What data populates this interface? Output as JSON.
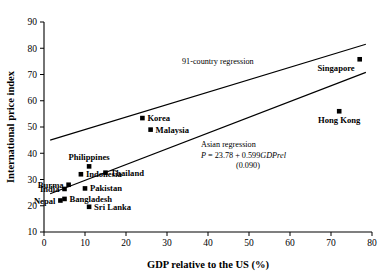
{
  "chart_data": {
    "type": "scatter",
    "title": "",
    "xlabel": "GDP relative to the US (%)",
    "ylabel": "International price index",
    "xlim": [
      0,
      80
    ],
    "ylim": [
      10,
      90
    ],
    "xticks": [
      0,
      10,
      20,
      30,
      40,
      50,
      60,
      70,
      80
    ],
    "yticks": [
      10,
      20,
      30,
      40,
      50,
      60,
      70,
      80,
      90
    ],
    "grid": false,
    "legend": "none",
    "points": [
      {
        "label": "Nepal",
        "x": 4,
        "y": 22.0,
        "label_pos": "left"
      },
      {
        "label": "Bangladesh",
        "x": 5,
        "y": 22.6,
        "label_pos": "right"
      },
      {
        "label": "India",
        "x": 5,
        "y": 26.4,
        "label_pos": "left"
      },
      {
        "label": "Burma",
        "x": 6,
        "y": 28.0,
        "label_pos": "left"
      },
      {
        "label": "Indonesia",
        "x": 9,
        "y": 32.0,
        "label_pos": "right"
      },
      {
        "label": "Pakistan",
        "x": 10,
        "y": 26.6,
        "label_pos": "right"
      },
      {
        "label": "Sri Lanka",
        "x": 11,
        "y": 19.6,
        "label_pos": "right"
      },
      {
        "label": "Philippines",
        "x": 11,
        "y": 35.0,
        "label_pos": "above"
      },
      {
        "label": "Thailand",
        "x": 15,
        "y": 32.6,
        "label_pos": "right"
      },
      {
        "label": "Korea",
        "x": 24,
        "y": 53.4,
        "label_pos": "right"
      },
      {
        "label": "Malaysia",
        "x": 26,
        "y": 49.0,
        "label_pos": "right"
      },
      {
        "label": "Hong Kong",
        "x": 72,
        "y": 56.0,
        "label_pos": "below"
      },
      {
        "label": "Singapore",
        "x": 77,
        "y": 75.8,
        "label_pos": "belowleft"
      }
    ],
    "lines": [
      {
        "name": "91-country regression",
        "annotation": "91-country regression",
        "x1": 1.5,
        "y1": 45.0,
        "x2": 78.5,
        "y2": 81.5
      },
      {
        "name": "Asian regression",
        "annotation": "Asian regression",
        "equation": "P = 23.78 + 0.599GDPrel",
        "std_error": "(0.090)",
        "x1": 1.5,
        "y1": 24.6,
        "x2": 78.5,
        "y2": 70.8
      }
    ],
    "annotations": {
      "country_regression_label": "91-country regression",
      "asian_regression_label": "Asian regression",
      "asian_equation_prefix": "P",
      "asian_equation_body": " = 23.78 + 0.599",
      "asian_equation_var": "GDPrel",
      "asian_equation_se": "(0.090)"
    },
    "marker_color": "#000000",
    "line_color": "#000000"
  }
}
